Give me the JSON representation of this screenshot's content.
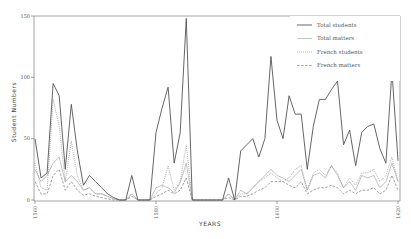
{
  "chart_data": {
    "type": "line",
    "title": "",
    "xlabel": "YEARS",
    "ylabel": "Student Numbers",
    "xlim": [
      1560,
      1620
    ],
    "ylim": [
      0,
      150
    ],
    "x_ticks": [
      "1560",
      "1580",
      "1600",
      "1620"
    ],
    "y_ticks": [
      "0",
      "50",
      "100",
      "150"
    ],
    "grid": false,
    "legend_position": "upper right",
    "x": [
      1560,
      1561,
      1562,
      1563,
      1564,
      1565,
      1566,
      1567,
      1568,
      1569,
      1570,
      1571,
      1572,
      1573,
      1574,
      1575,
      1576,
      1577,
      1578,
      1579,
      1580,
      1581,
      1582,
      1583,
      1584,
      1585,
      1586,
      1587,
      1588,
      1589,
      1590,
      1591,
      1592,
      1593,
      1594,
      1595,
      1596,
      1597,
      1598,
      1599,
      1600,
      1601,
      1602,
      1603,
      1604,
      1605,
      1606,
      1607,
      1608,
      1609,
      1610,
      1611,
      1612,
      1613,
      1614,
      1615,
      1616,
      1617,
      1618,
      1619,
      1620
    ],
    "series": [
      {
        "name": "Total students",
        "style": "solid",
        "values": [
          50,
          18,
          22,
          95,
          85,
          25,
          78,
          40,
          12,
          20,
          15,
          10,
          5,
          2,
          0,
          0,
          20,
          0,
          0,
          0,
          55,
          75,
          92,
          30,
          55,
          148,
          0,
          0,
          0,
          0,
          0,
          0,
          18,
          0,
          40,
          45,
          50,
          35,
          50,
          117,
          65,
          50,
          85,
          70,
          70,
          25,
          60,
          82,
          82,
          90,
          97,
          45,
          57,
          28,
          55,
          60,
          62,
          42,
          30,
          105,
          32
        ]
      },
      {
        "name": "Total matters",
        "style": "solid-thin",
        "values": [
          25,
          15,
          20,
          30,
          35,
          15,
          20,
          15,
          8,
          10,
          5,
          5,
          3,
          1,
          0,
          0,
          5,
          0,
          0,
          0,
          10,
          12,
          10,
          6,
          14,
          30,
          0,
          0,
          0,
          0,
          0,
          0,
          5,
          0,
          8,
          5,
          10,
          15,
          20,
          25,
          20,
          18,
          15,
          20,
          25,
          8,
          20,
          22,
          18,
          28,
          20,
          10,
          15,
          8,
          20,
          18,
          20,
          10,
          15,
          30,
          15
        ]
      },
      {
        "name": "French students",
        "style": "dotted",
        "values": [
          30,
          10,
          8,
          82,
          60,
          15,
          48,
          20,
          8,
          10,
          5,
          5,
          3,
          1,
          0,
          0,
          5,
          0,
          0,
          0,
          5,
          10,
          28,
          8,
          15,
          45,
          0,
          0,
          0,
          0,
          0,
          0,
          5,
          0,
          5,
          5,
          10,
          15,
          18,
          22,
          18,
          15,
          18,
          25,
          28,
          8,
          22,
          25,
          20,
          28,
          22,
          10,
          18,
          12,
          22,
          22,
          25,
          15,
          20,
          35,
          15
        ]
      },
      {
        "name": "French matters",
        "style": "dashed",
        "values": [
          15,
          5,
          5,
          20,
          25,
          8,
          15,
          8,
          4,
          5,
          3,
          2,
          1,
          0,
          0,
          0,
          3,
          0,
          0,
          0,
          3,
          5,
          8,
          5,
          8,
          18,
          0,
          0,
          0,
          0,
          0,
          0,
          2,
          0,
          3,
          3,
          5,
          8,
          10,
          15,
          15,
          15,
          12,
          10,
          15,
          5,
          8,
          10,
          10,
          12,
          10,
          5,
          8,
          5,
          8,
          8,
          10,
          5,
          8,
          20,
          8
        ]
      }
    ]
  },
  "legend": {
    "items": [
      {
        "label": "Total students",
        "dash": ""
      },
      {
        "label": "Total matters",
        "dash": ""
      },
      {
        "label": "French students",
        "dash": "1,1.5"
      },
      {
        "label": "French matters",
        "dash": "2.5,1.5"
      }
    ]
  },
  "axes": {
    "xlabel": "YEARS",
    "ylabel": "Student Numbers"
  }
}
